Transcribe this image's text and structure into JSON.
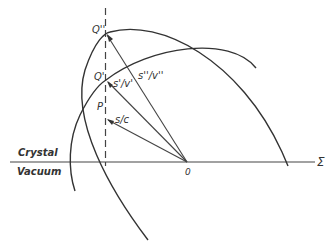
{
  "diagram": {
    "regions": {
      "upper": "Crystal",
      "lower": "Vacuum"
    },
    "axis_label": "Σ",
    "origin_label": "0",
    "points": [
      {
        "id": "Q2",
        "label": "Q''",
        "x": 106,
        "y": 33
      },
      {
        "id": "Q1",
        "label": "Q'",
        "x": 106,
        "y": 80
      },
      {
        "id": "P",
        "label": "P",
        "x": 106,
        "y": 118
      }
    ],
    "vectors": [
      {
        "from": "O",
        "to": "Q2",
        "label": "s''/v''"
      },
      {
        "from": "O",
        "to": "Q1",
        "label": "s'/v'"
      },
      {
        "from": "O",
        "to": "P",
        "label": "s/c"
      }
    ],
    "colors": {
      "line": "#333333",
      "background": "#ffffff"
    }
  }
}
